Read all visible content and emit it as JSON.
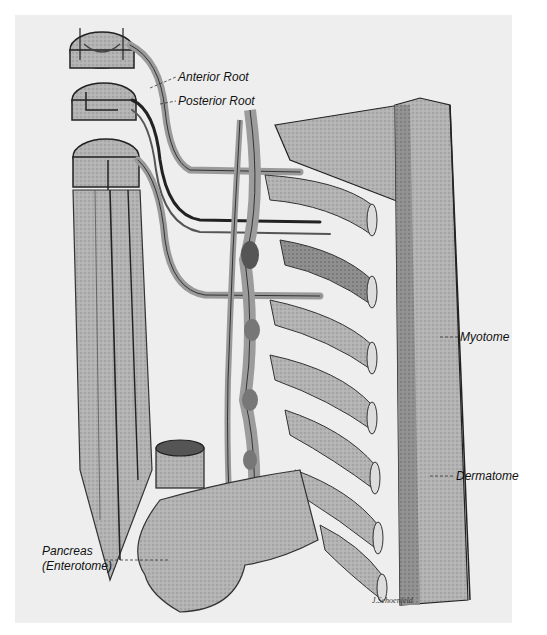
{
  "figure": {
    "background": "#eeeeee",
    "ink_color": "#1a1a1a",
    "tissue_color": "#a9a9a9",
    "labels": {
      "anterior_root": "Anterior Root",
      "posterior_root": "Posterior Root",
      "myotome": "Myotome",
      "dermatome": "Dermatome",
      "pancreas": "Pancreas",
      "enterotome": "(Enterotome)"
    },
    "signature": "J.Schoenfeld"
  }
}
